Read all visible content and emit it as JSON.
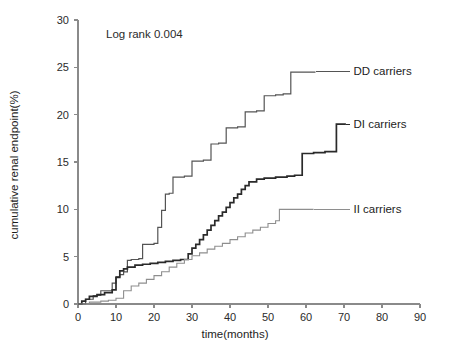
{
  "figure": {
    "title": "",
    "annotation": "Log rank 0.004",
    "background_color": "#ffffff"
  },
  "chart_data": {
    "type": "line",
    "subtype": "kaplan-meier-step",
    "title": "",
    "annotation": "Log rank 0.004",
    "xlabel": "time(months)",
    "ylabel": "cumulative renal endpoint(%)",
    "xlim": [
      0,
      90
    ],
    "ylim": [
      0,
      30
    ],
    "xticks": [
      0,
      10,
      20,
      30,
      40,
      50,
      60,
      70,
      80,
      90
    ],
    "yticks": [
      0,
      5,
      10,
      15,
      20,
      25,
      30
    ],
    "grid": false,
    "legend_position": "inline-right-of-curve-ends",
    "series": [
      {
        "name": "DD carriers",
        "label": "DD carriers",
        "color": "#545454",
        "stroke_width": 1.2,
        "label_x": 72.5,
        "label_y": 24.6,
        "leader_from_x": 62.5,
        "points": [
          [
            0,
            0
          ],
          [
            2,
            0.5
          ],
          [
            4,
            0.9
          ],
          [
            6,
            1.4
          ],
          [
            8,
            1.4
          ],
          [
            9,
            2.2
          ],
          [
            10,
            2.9
          ],
          [
            11,
            3.1
          ],
          [
            12,
            3.4
          ],
          [
            13,
            4.6
          ],
          [
            14,
            4.7
          ],
          [
            16,
            4.8
          ],
          [
            17,
            6.3
          ],
          [
            20,
            6.4
          ],
          [
            21,
            8.1
          ],
          [
            22,
            9.9
          ],
          [
            23,
            11.6
          ],
          [
            24,
            11.7
          ],
          [
            25,
            13.4
          ],
          [
            28,
            13.5
          ],
          [
            30,
            15.1
          ],
          [
            33,
            15.2
          ],
          [
            35,
            16.9
          ],
          [
            37,
            17.0
          ],
          [
            39,
            18.6
          ],
          [
            42,
            18.7
          ],
          [
            44,
            20.3
          ],
          [
            47,
            20.4
          ],
          [
            49,
            22.0
          ],
          [
            52,
            22.1
          ],
          [
            54,
            22.2
          ],
          [
            56,
            24.5
          ],
          [
            62.5,
            24.5
          ]
        ]
      },
      {
        "name": "DI carriers",
        "label": "DI carriers",
        "color": "#2a2a2a",
        "stroke_width": 1.7,
        "label_x": 72.5,
        "label_y": 19.0,
        "leader_from_x": 70.5,
        "points": [
          [
            0,
            0
          ],
          [
            1,
            0.3
          ],
          [
            2,
            0.5
          ],
          [
            3,
            0.8
          ],
          [
            5,
            1.0
          ],
          [
            7,
            1.2
          ],
          [
            9,
            1.5
          ],
          [
            10,
            2.8
          ],
          [
            11,
            3.5
          ],
          [
            12,
            3.7
          ],
          [
            13,
            3.9
          ],
          [
            15,
            4.1
          ],
          [
            17,
            4.2
          ],
          [
            19,
            4.3
          ],
          [
            21,
            4.4
          ],
          [
            23,
            4.5
          ],
          [
            25,
            4.6
          ],
          [
            27,
            4.7
          ],
          [
            29,
            5.3
          ],
          [
            30,
            5.9
          ],
          [
            31,
            6.3
          ],
          [
            32,
            6.8
          ],
          [
            33,
            7.3
          ],
          [
            34,
            7.8
          ],
          [
            35,
            8.3
          ],
          [
            36,
            8.8
          ],
          [
            37,
            9.3
          ],
          [
            38,
            9.7
          ],
          [
            39,
            10.2
          ],
          [
            40,
            10.7
          ],
          [
            41,
            11.2
          ],
          [
            42,
            11.6
          ],
          [
            43,
            12.1
          ],
          [
            44,
            12.5
          ],
          [
            45,
            12.9
          ],
          [
            47,
            13.2
          ],
          [
            49,
            13.3
          ],
          [
            52,
            13.4
          ],
          [
            55,
            13.5
          ],
          [
            57,
            13.6
          ],
          [
            59,
            15.9
          ],
          [
            62,
            16.0
          ],
          [
            65,
            16.1
          ],
          [
            68,
            19.0
          ],
          [
            70.5,
            19.0
          ]
        ]
      },
      {
        "name": "II carriers",
        "label": "II carriers",
        "color": "#8e8e8e",
        "stroke_width": 1.1,
        "label_x": 72.5,
        "label_y": 10.0,
        "leader_from_x": 62.0,
        "points": [
          [
            0,
            0
          ],
          [
            3,
            0.2
          ],
          [
            6,
            0.3
          ],
          [
            8,
            0.4
          ],
          [
            10,
            0.6
          ],
          [
            12,
            1.4
          ],
          [
            14,
            1.9
          ],
          [
            16,
            2.2
          ],
          [
            18,
            2.6
          ],
          [
            20,
            3.0
          ],
          [
            22,
            3.4
          ],
          [
            24,
            3.9
          ],
          [
            26,
            4.3
          ],
          [
            28,
            4.7
          ],
          [
            30,
            5.1
          ],
          [
            32,
            5.4
          ],
          [
            34,
            5.8
          ],
          [
            36,
            6.1
          ],
          [
            38,
            6.4
          ],
          [
            40,
            6.8
          ],
          [
            42,
            7.1
          ],
          [
            44,
            7.5
          ],
          [
            46,
            7.8
          ],
          [
            48,
            8.1
          ],
          [
            50,
            8.5
          ],
          [
            52,
            8.8
          ],
          [
            53,
            10.0
          ],
          [
            62,
            10.0
          ]
        ]
      }
    ]
  }
}
